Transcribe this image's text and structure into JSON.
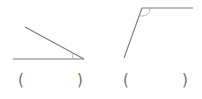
{
  "diagram": {
    "type": "angle-identification-exercise",
    "stroke_color": "#7a7a7a",
    "arc_color": "#a8a8a8",
    "figures": [
      {
        "id": "angle-1",
        "kind": "acute",
        "vertex": [
          84,
          59
        ],
        "ray_a_end": [
          13,
          59
        ],
        "ray_b_end": [
          25,
          27
        ],
        "answer_open": "(",
        "answer_close": ")"
      },
      {
        "id": "angle-2",
        "kind": "obtuse",
        "vertex": [
          142,
          8
        ],
        "ray_a_end": [
          193,
          8
        ],
        "ray_b_end": [
          124,
          58
        ],
        "answer_open": "(",
        "answer_close": ")"
      }
    ]
  }
}
